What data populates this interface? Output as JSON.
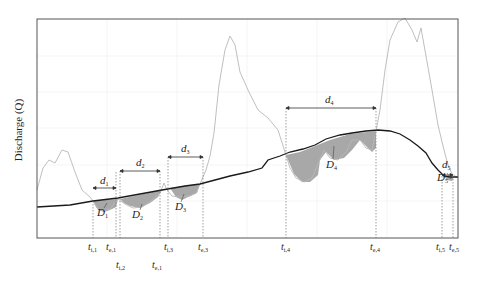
{
  "figure": {
    "y_axis_label": "Discharge (Q)",
    "colors": {
      "frame": "#555555",
      "grid": "#eeeeee",
      "hydrograph": "#b8b8b8",
      "threshold": "#1a1a1a",
      "deficit_fill": "#9a9a9a",
      "marker_line": "#777777"
    },
    "durations": [
      {
        "label": "d",
        "sub": "1"
      },
      {
        "label": "d",
        "sub": "2"
      },
      {
        "label": "d",
        "sub": "3"
      },
      {
        "label": "d",
        "sub": "4"
      },
      {
        "label": "d",
        "sub": "5"
      }
    ],
    "deficits": [
      {
        "label": "D",
        "sub": "1"
      },
      {
        "label": "D",
        "sub": "2"
      },
      {
        "label": "D",
        "sub": "3"
      },
      {
        "label": "D",
        "sub": "4"
      },
      {
        "label": "D",
        "sub": "5"
      }
    ],
    "time_markers": [
      {
        "label": "t",
        "sub": "i,1"
      },
      {
        "label": "t",
        "sub": "e,1"
      },
      {
        "label": "t",
        "sub": "i,2"
      },
      {
        "label": "t",
        "sub": "e,1"
      },
      {
        "label": "t",
        "sub": "i,3"
      },
      {
        "label": "t",
        "sub": "e,3"
      },
      {
        "label": "t",
        "sub": "i,4"
      },
      {
        "label": "t",
        "sub": "e,4"
      },
      {
        "label": "t",
        "sub": "i,5"
      },
      {
        "label": "t",
        "sub": "e,5"
      }
    ]
  }
}
